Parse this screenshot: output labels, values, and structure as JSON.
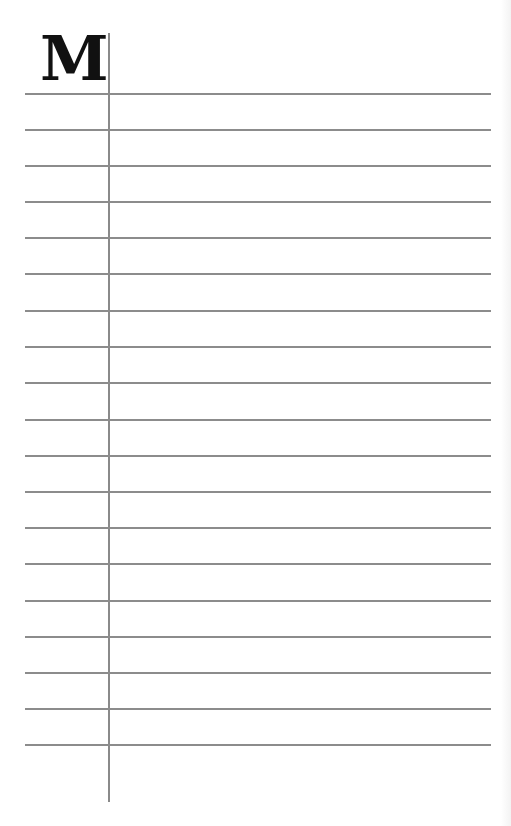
{
  "page": {
    "type": "ruled index page",
    "index_letter": "M",
    "rule_color": "#8c8c8c",
    "margin_line_color": "#8a8a8a",
    "rule_count": 19,
    "rules_y": [
      93,
      129,
      165,
      201,
      237,
      273,
      310,
      346,
      382,
      419,
      455,
      491,
      527,
      563,
      600,
      636,
      672,
      708,
      744
    ]
  }
}
